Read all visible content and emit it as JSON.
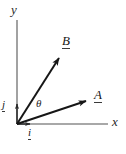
{
  "figure": {
    "kind": "vector-diagram",
    "width": 126,
    "height": 154,
    "background_color": "#ffffff",
    "stroke_color": "#2a2a2a",
    "vector_color": "#161616"
  },
  "axes": {
    "x_label": "x",
    "y_label": "y",
    "origin": {
      "x": 17,
      "y": 124
    },
    "x_axis_end": {
      "x": 108,
      "y": 124
    },
    "y_axis_top": {
      "x": 17,
      "y": 20
    }
  },
  "unit_vectors": [
    {
      "label": "i",
      "name": "unit-vector-i",
      "from": {
        "x": 17,
        "y": 124
      },
      "to": {
        "x": 31,
        "y": 124
      },
      "underlined": true
    },
    {
      "label": "j",
      "name": "unit-vector-j",
      "from": {
        "x": 17,
        "y": 124
      },
      "to": {
        "x": 17,
        "y": 103
      },
      "underlined": true
    }
  ],
  "vectors": [
    {
      "label": "B",
      "name": "vector-B",
      "from": {
        "x": 17,
        "y": 124
      },
      "to": {
        "x": 60,
        "y": 57
      },
      "underlined": true
    },
    {
      "label": "A",
      "name": "vector-A",
      "from": {
        "x": 17,
        "y": 124
      },
      "to": {
        "x": 87,
        "y": 101
      },
      "underlined": true
    }
  ],
  "angle": {
    "label": "θ",
    "name": "angle-theta",
    "between": [
      "A",
      "B"
    ]
  }
}
